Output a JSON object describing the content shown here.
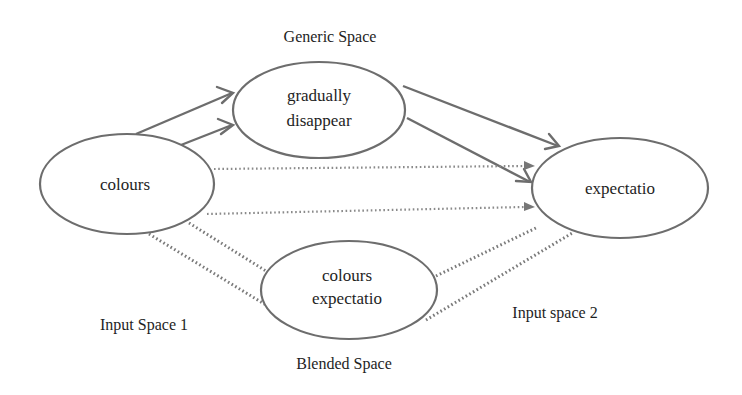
{
  "diagram": {
    "labels": {
      "generic_space": "Generic Space",
      "input_space_1": "Input Space 1",
      "input_space_2": "Input space 2",
      "blended_space": "Blended Space"
    },
    "nodes": {
      "input1": {
        "lines": [
          "colours"
        ]
      },
      "generic": {
        "lines": [
          "gradually",
          "disappear"
        ]
      },
      "input2": {
        "lines": [
          "expectatio"
        ]
      },
      "blend": {
        "lines": [
          "colours",
          "expectatio"
        ]
      }
    },
    "edges": [
      {
        "from": "input1",
        "to": "generic",
        "style": "solid-arrow",
        "count": 2
      },
      {
        "from": "generic",
        "to": "input2",
        "style": "solid-arrow",
        "count": 2
      },
      {
        "from": "input1",
        "to": "input2",
        "style": "dotted-arrow",
        "count": 2
      },
      {
        "from": "input1",
        "to": "blend",
        "style": "dotted-line",
        "count": 2
      },
      {
        "from": "blend",
        "to": "input2",
        "style": "dotted-line",
        "count": 2
      }
    ],
    "colors": {
      "stroke": "#6d6d6d",
      "text": "#1e1e1e",
      "background": "#ffffff"
    }
  }
}
